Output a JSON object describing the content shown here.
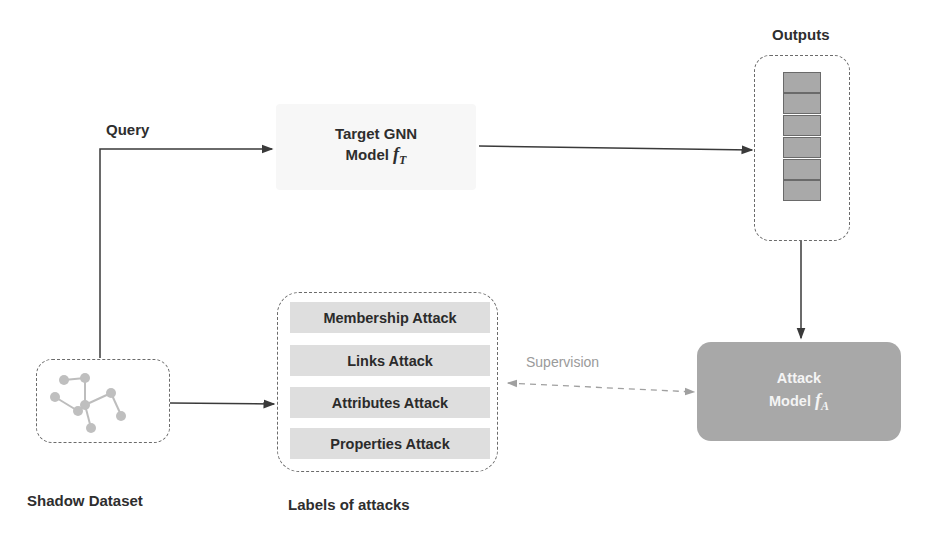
{
  "labels": {
    "query": "Query",
    "outputs": "Outputs",
    "shadow_dataset": "Shadow Dataset",
    "labels_of_attacks": "Labels of attacks",
    "supervision": "Supervision"
  },
  "target_model": {
    "line1": "Target GNN",
    "line2_prefix": "Model ",
    "symbol": "f",
    "subscript": "T"
  },
  "attack_model": {
    "line1": "Attack",
    "line2_prefix": "Model ",
    "symbol": "f",
    "subscript": "A"
  },
  "attacks": [
    {
      "label": "Membership Attack"
    },
    {
      "label": "Links Attack"
    },
    {
      "label": "Attributes Attack"
    },
    {
      "label": "Properties Attack"
    }
  ],
  "outputs": {
    "cell_count": 6
  },
  "colors": {
    "attack_model_fill": "#a8a8a8",
    "output_cell_fill": "#a9a9a9",
    "attack_item_fill": "#dedede",
    "target_box_fill": "#f7f7f7",
    "line": "#3a3a3a",
    "dashed_arrow": "#a0a0a0"
  }
}
